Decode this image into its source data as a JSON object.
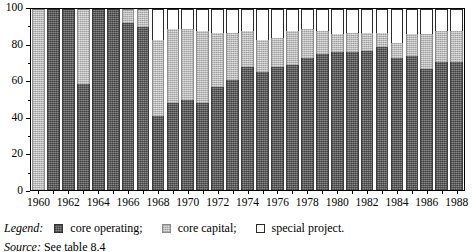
{
  "chart_data": {
    "type": "bar",
    "subtype": "stacked-percentage",
    "title": "",
    "xlabel": "",
    "ylabel": "",
    "ylim": [
      0,
      100
    ],
    "y_major_ticks": [
      0,
      20,
      40,
      60,
      80,
      100
    ],
    "y_minor_ticks": [
      10,
      30,
      50,
      70,
      90
    ],
    "grid": false,
    "legend_position": "below-axis",
    "categories": [
      "1960",
      "1961",
      "1962",
      "1963",
      "1964",
      "1965",
      "1966",
      "1967",
      "1968",
      "1969",
      "1970",
      "1971",
      "1972",
      "1973",
      "1974",
      "1975",
      "1976",
      "1977",
      "1978",
      "1979",
      "1980",
      "1981",
      "1982",
      "1983",
      "1984",
      "1985",
      "1986",
      "1987",
      "1988"
    ],
    "tick_labels": [
      "1960",
      "",
      "1962",
      "",
      "1964",
      "",
      "1966",
      "",
      "1968",
      "",
      "1970",
      "",
      "1972",
      "",
      "1974",
      "",
      "1976",
      "",
      "1978",
      "",
      "1980",
      "",
      "1982",
      "",
      "1984",
      "",
      "1986",
      "",
      "1988"
    ],
    "series": [
      {
        "name": "core operating",
        "color": "#666666",
        "values": [
          0,
          100,
          100,
          58.5,
          100,
          100,
          92,
          90,
          41,
          48,
          50,
          48,
          57,
          61,
          68,
          65,
          68,
          69,
          73,
          75,
          76,
          76,
          77,
          79,
          73,
          74,
          67,
          71,
          71
        ]
      },
      {
        "name": "core capital",
        "color": "#c2c2c2",
        "values": [
          100,
          0,
          0,
          41.5,
          0,
          0,
          8,
          10,
          42,
          41,
          39,
          40,
          30,
          26,
          20,
          18,
          16,
          19,
          16,
          13,
          10,
          11,
          10,
          8,
          8,
          12,
          19,
          17,
          17
        ]
      },
      {
        "name": "special project",
        "color": "#ffffff",
        "values": [
          0,
          0,
          0,
          0,
          0,
          0,
          0,
          0,
          17,
          11,
          11,
          12,
          13,
          13,
          12,
          17,
          16,
          12,
          11,
          12,
          14,
          13,
          13,
          13,
          19,
          14,
          14,
          12,
          12
        ]
      }
    ]
  },
  "y_axis": {
    "labels": [
      "100",
      "80",
      "60",
      "40",
      "20",
      "0"
    ]
  },
  "legend": {
    "title": "Legend",
    "title_suffix": ":",
    "entries": [
      {
        "swatch": "operating",
        "label": "core operating;"
      },
      {
        "swatch": "capital",
        "label": "core capital;"
      },
      {
        "swatch": "special",
        "label": "special project."
      }
    ]
  },
  "source": {
    "label": "Source",
    "label_suffix": ":",
    "text": "See table 8.4"
  }
}
